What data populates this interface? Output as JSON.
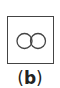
{
  "figure": {
    "shape": "two-touching-circles-in-square",
    "stroke_color": "#444444",
    "background": "#ffffff"
  },
  "caption": {
    "open": "(",
    "label": "b",
    "close": ")"
  }
}
